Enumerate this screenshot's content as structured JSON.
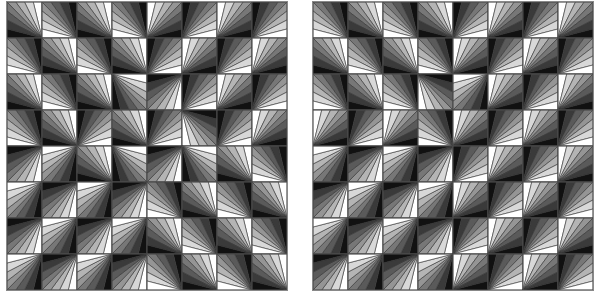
{
  "figure": {
    "grid_size": 8,
    "wedges_per_tile": 8,
    "shades": [
      "#ffffff",
      "#d8d8d8",
      "#b4b4b4",
      "#959595",
      "#777777",
      "#5a5a5a",
      "#3a3a3a",
      "#111111"
    ],
    "stroke_color": "#333333",
    "corner_legend": [
      "top-left",
      "top-right",
      "bottom-left",
      "bottom-right"
    ]
  },
  "panels": [
    {
      "id": "left",
      "corners": [
        [
          3,
          3,
          3,
          3,
          2,
          2,
          2,
          2
        ],
        [
          3,
          3,
          3,
          3,
          2,
          2,
          2,
          2
        ],
        [
          3,
          3,
          3,
          0,
          1,
          2,
          2,
          2
        ],
        [
          3,
          3,
          2,
          3,
          2,
          0,
          2,
          2
        ],
        [
          1,
          1,
          3,
          0,
          1,
          0,
          3,
          3
        ],
        [
          1,
          1,
          1,
          1,
          3,
          3,
          3,
          3
        ],
        [
          1,
          1,
          1,
          1,
          3,
          3,
          3,
          3
        ],
        [
          1,
          1,
          1,
          1,
          3,
          3,
          3,
          3
        ]
      ],
      "invert_phase": 0
    },
    {
      "id": "right",
      "corners": [
        [
          3,
          3,
          3,
          3,
          2,
          2,
          2,
          2
        ],
        [
          3,
          3,
          3,
          3,
          2,
          2,
          2,
          2
        ],
        [
          3,
          3,
          3,
          0,
          1,
          2,
          2,
          2
        ],
        [
          2,
          2,
          2,
          3,
          2,
          2,
          2,
          2
        ],
        [
          1,
          1,
          1,
          1,
          2,
          2,
          2,
          2
        ],
        [
          1,
          1,
          1,
          1,
          2,
          2,
          2,
          2
        ],
        [
          1,
          1,
          1,
          1,
          2,
          2,
          2,
          2
        ],
        [
          1,
          1,
          1,
          1,
          2,
          2,
          2,
          2
        ]
      ],
      "invert_phase": 1
    }
  ]
}
